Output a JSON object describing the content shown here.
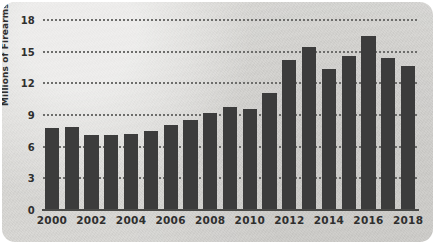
{
  "card": {
    "background_color": "#d9d8d5",
    "page_background_color": "#ffffff"
  },
  "chart_data": {
    "type": "bar",
    "title": "",
    "xlabel": "",
    "ylabel": "Millions of Firearms Sold",
    "categories": [
      "2000",
      "2001",
      "2002",
      "2003",
      "2004",
      "2005",
      "2006",
      "2007",
      "2008",
      "2009",
      "2010",
      "2011",
      "2012",
      "2013",
      "2014",
      "2015",
      "2016",
      "2017",
      "2018"
    ],
    "values": [
      7.8,
      7.9,
      7.1,
      7.1,
      7.2,
      7.5,
      8.1,
      8.5,
      9.2,
      9.8,
      9.6,
      11.1,
      14.2,
      15.4,
      13.4,
      14.6,
      16.5,
      14.4,
      13.6
    ],
    "ylim": [
      0,
      18
    ],
    "yticks": [
      0,
      3,
      6,
      9,
      12,
      15,
      18
    ],
    "ytick_labels": [
      "0",
      "3",
      "6",
      "9",
      "12",
      "15",
      "18"
    ],
    "xtick_labels": [
      "2000",
      "2002",
      "2004",
      "2006",
      "2008",
      "2010",
      "2012",
      "2014",
      "2016",
      "2018"
    ],
    "grid": true,
    "grid_style": "dotted",
    "legend": false,
    "bar_color": "#3c3c3c",
    "grid_color": "#6d6d6b",
    "axis_text_color": "#2f2f2f"
  }
}
